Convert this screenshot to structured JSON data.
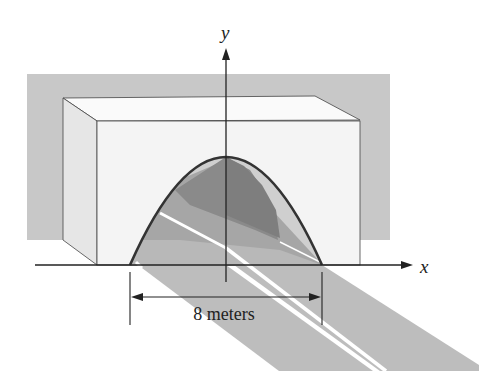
{
  "figure": {
    "axes": {
      "x_label": "x",
      "y_label": "y"
    },
    "dimension": {
      "label": "8 meters",
      "value": 8,
      "unit": "meters"
    },
    "colors": {
      "background_wall": "#c8c8c8",
      "block_front": "#f4f4f4",
      "block_side": "#e6e6e6",
      "block_top": "#fafafa",
      "road": "#bdbdbd",
      "arch_dark": "#8a8a8a",
      "arch_mid": "#a6a6a6",
      "arch_light": "#cfcfcf",
      "outline": "#333333",
      "road_stripe": "#ffffff"
    }
  }
}
